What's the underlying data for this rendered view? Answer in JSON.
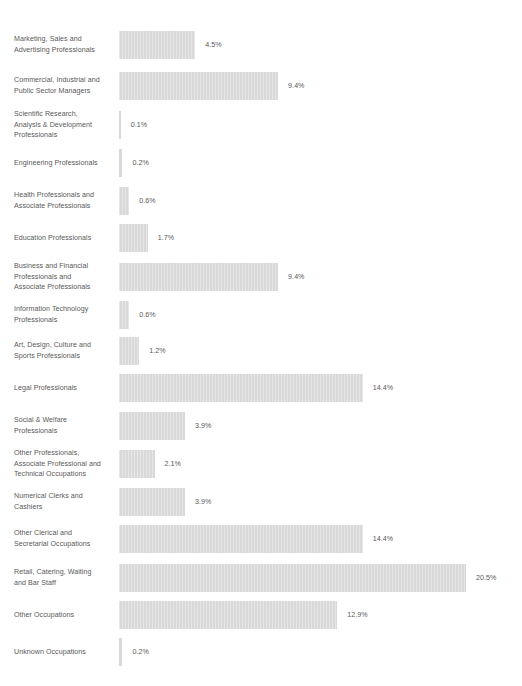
{
  "chart_data": {
    "type": "bar",
    "orientation": "horizontal",
    "title": "",
    "subtitle": "",
    "xlabel": "",
    "ylabel": "",
    "grid": false,
    "legend": false,
    "value_suffix": "%",
    "xlim": [
      0,
      20.5
    ],
    "bar_color": "#d9d9d9",
    "text_color": "#595959",
    "categories": [
      "Marketing, Sales and Advertising Professionals",
      "Commercial, Industrial and Public Sector Managers",
      "Scientific Research, Analysis & Development Professionals",
      "Engineering Professionals",
      "Health Professionals and Associate Professionals",
      "Education Professionals",
      "Business and Financial Professionals and Associate Professionals",
      "Information Technology Professionals",
      "Art, Design, Culture and Sports Professionals",
      "Legal Professionals",
      "Social & Welfare Professionals",
      "Other Professionals, Associate Professional and Technical Occupations",
      "Numerical Clerks and Cashiers",
      "Other Clerical and Secretarial Occupations",
      "Retail, Catering, Waiting and Bar Staff",
      "Other Occupations",
      "Unknown Occupations"
    ],
    "values": [
      4.5,
      9.4,
      0.1,
      0.2,
      0.6,
      1.7,
      9.4,
      0.6,
      1.2,
      14.4,
      3.9,
      2.1,
      3.9,
      14.4,
      20.5,
      12.9,
      0.2
    ],
    "value_labels": [
      "4.5%",
      "9.4%",
      "0.1%",
      "0.2%",
      "0.6%",
      "1.7%",
      "9.4%",
      "0.6%",
      "1.2%",
      "14.4%",
      "3.9%",
      "2.1%",
      "3.9%",
      "14.4%",
      "20.5%",
      "12.9%",
      "0.2%"
    ],
    "rows": [
      {
        "label_lines": [
          "Marketing, Sales and",
          "Advertising Professionals"
        ],
        "value": 4.5,
        "value_label": "4.5%",
        "center_y": 45
      },
      {
        "label_lines": [
          "Commercial, Industrial and",
          "Public Sector Managers"
        ],
        "value": 9.4,
        "value_label": "9.4%",
        "center_y": 86
      },
      {
        "label_lines": [
          "Scientific Research,",
          "Analysis & Development",
          "Professionals"
        ],
        "value": 0.1,
        "value_label": "0.1%",
        "center_y": 125
      },
      {
        "label_lines": [
          "Engineering Professionals"
        ],
        "value": 0.2,
        "value_label": "0.2%",
        "center_y": 163
      },
      {
        "label_lines": [
          "Health Professionals and",
          "Associate Professionals"
        ],
        "value": 0.6,
        "value_label": "0.6%",
        "center_y": 201
      },
      {
        "label_lines": [
          "Education Professionals"
        ],
        "value": 1.7,
        "value_label": "1.7%",
        "center_y": 238
      },
      {
        "label_lines": [
          "Business and Financial",
          "Professionals and",
          "Associate Professionals"
        ],
        "value": 9.4,
        "value_label": "9.4%",
        "center_y": 277
      },
      {
        "label_lines": [
          "Information Technology",
          "Professionals"
        ],
        "value": 0.6,
        "value_label": "0.6%",
        "center_y": 315
      },
      {
        "label_lines": [
          "Art, Design, Culture and",
          "Sports Professionals"
        ],
        "value": 1.2,
        "value_label": "1.2%",
        "center_y": 351
      },
      {
        "label_lines": [
          "Legal Professionals"
        ],
        "value": 14.4,
        "value_label": "14.4%",
        "center_y": 388
      },
      {
        "label_lines": [
          "Social & Welfare",
          "Professionals"
        ],
        "value": 3.9,
        "value_label": "3.9%",
        "center_y": 426
      },
      {
        "label_lines": [
          "Other Professionals,",
          "Associate Professional and",
          "Technical Occupations"
        ],
        "value": 2.1,
        "value_label": "2.1%",
        "center_y": 464
      },
      {
        "label_lines": [
          "Numerical Clerks and",
          "Cashiers"
        ],
        "value": 3.9,
        "value_label": "3.9%",
        "center_y": 502
      },
      {
        "label_lines": [
          "Other Clerical and",
          "Secretarial Occupations"
        ],
        "value": 14.4,
        "value_label": "14.4%",
        "center_y": 539
      },
      {
        "label_lines": [
          "Retail, Catering, Waiting",
          "and Bar Staff"
        ],
        "value": 20.5,
        "value_label": "20.5%",
        "center_y": 578
      },
      {
        "label_lines": [
          "Other Occupations"
        ],
        "value": 12.9,
        "value_label": "12.9%",
        "center_y": 615
      },
      {
        "label_lines": [
          "Unknown Occupations"
        ],
        "value": 0.2,
        "value_label": "0.2%",
        "center_y": 652
      }
    ]
  }
}
